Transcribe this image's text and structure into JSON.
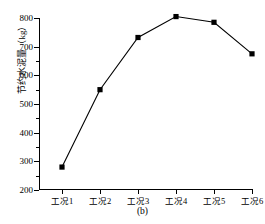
{
  "chart_data": {
    "type": "line",
    "title": "",
    "subtitle": "",
    "xlabel": "",
    "ylabel": "节约水泥量（kg）",
    "categories": [
      "工况1",
      "工况2",
      "工况3",
      "工况4",
      "工况5",
      "工况6"
    ],
    "values": [
      280,
      550,
      732,
      805,
      785,
      675
    ],
    "series": [
      {
        "name": "节约水泥量",
        "values": [
          280,
          550,
          732,
          805,
          785,
          675
        ]
      }
    ],
    "ylim": [
      200,
      800
    ],
    "yticks": [
      200,
      300,
      400,
      500,
      600,
      700,
      800
    ],
    "ytick_labels": [
      "200",
      "300",
      "400",
      "500",
      "600",
      "700",
      "800"
    ],
    "yminor_ticks": [
      250,
      350,
      450,
      550,
      650,
      750
    ],
    "grid": false,
    "legend": false,
    "legend_position": "none",
    "marker": "square",
    "marker_color": "#000000",
    "line_color": "#000000",
    "axis_color": "#000000",
    "background": "#ffffff",
    "caption": "(b)"
  },
  "figure": {
    "caption": "(b)",
    "y_axis_title": "节约水泥量（kg）"
  }
}
